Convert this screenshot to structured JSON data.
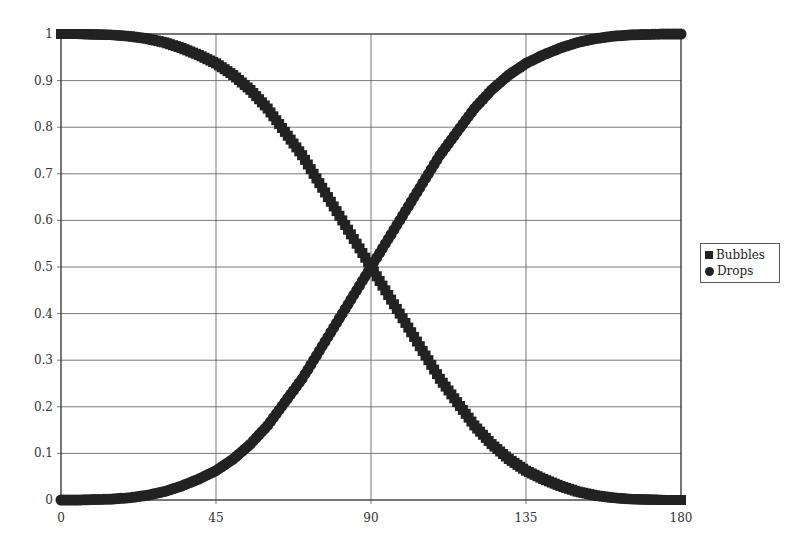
{
  "chart_data": {
    "type": "scatter",
    "title": "",
    "xlabel": "",
    "ylabel": "",
    "xlim": [
      0,
      180
    ],
    "ylim": [
      0,
      1
    ],
    "x_ticks": [
      "0",
      "45",
      "90",
      "135",
      "180"
    ],
    "y_ticks": [
      "0",
      "0.1",
      "0.2",
      "0.3",
      "0.4",
      "0.5",
      "0.6",
      "0.7",
      "0.8",
      "0.9",
      "1"
    ],
    "grid": true,
    "legend_position": "right",
    "x": [
      0,
      5,
      10,
      15,
      20,
      25,
      30,
      35,
      40,
      45,
      50,
      55,
      60,
      65,
      70,
      75,
      80,
      85,
      90,
      95,
      100,
      105,
      110,
      115,
      120,
      125,
      130,
      135,
      140,
      145,
      150,
      155,
      160,
      165,
      170,
      175,
      180
    ],
    "series": [
      {
        "name": "Bubbles",
        "marker": "square",
        "values": [
          1,
          1,
          0.999,
          0.998,
          0.995,
          0.99,
          0.982,
          0.97,
          0.955,
          0.937,
          0.912,
          0.88,
          0.84,
          0.79,
          0.74,
          0.68,
          0.62,
          0.56,
          0.5,
          0.44,
          0.38,
          0.32,
          0.26,
          0.21,
          0.16,
          0.12,
          0.088,
          0.063,
          0.045,
          0.03,
          0.018,
          0.01,
          0.005,
          0.002,
          0.001,
          0,
          0
        ]
      },
      {
        "name": "Drops",
        "marker": "circle",
        "values": [
          0,
          0,
          0.001,
          0.002,
          0.005,
          0.01,
          0.018,
          0.03,
          0.045,
          0.063,
          0.088,
          0.12,
          0.16,
          0.21,
          0.26,
          0.32,
          0.38,
          0.44,
          0.5,
          0.56,
          0.62,
          0.68,
          0.74,
          0.79,
          0.84,
          0.88,
          0.912,
          0.937,
          0.955,
          0.97,
          0.982,
          0.99,
          0.995,
          0.998,
          0.999,
          1,
          1
        ]
      }
    ]
  },
  "legend": {
    "items": [
      {
        "label": "Bubbles",
        "marker": "square"
      },
      {
        "label": "Drops",
        "marker": "circle"
      }
    ]
  },
  "colors": {
    "series": "#222222",
    "grid": "#555555",
    "axis": "#333333"
  }
}
